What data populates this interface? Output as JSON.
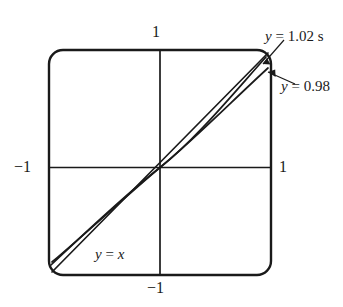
{
  "figure": {
    "title": "",
    "background_color": "#ffffff",
    "stroke_color": "#1a1a1a"
  },
  "axes": {
    "x_tick_labels": {
      "left": "−1",
      "right": "1"
    },
    "y_tick_labels": {
      "top": "1",
      "bottom": "−1"
    },
    "xlim": [
      -1,
      1
    ],
    "ylim": [
      -1,
      1
    ],
    "frame": "rounded-square",
    "grid": false
  },
  "annotations": [
    {
      "id": "c1",
      "text": "y = 1.02 s",
      "italic_var": "y",
      "clipped": true,
      "leader": true
    },
    {
      "id": "c2",
      "text": "y = 0.98",
      "italic_var": "y",
      "clipped": true,
      "leader": true
    },
    {
      "id": "c3",
      "text": "y = x",
      "italic_var": "y",
      "clipped": false,
      "leader": false
    }
  ],
  "chart_data": {
    "type": "line",
    "title": "",
    "xlabel": "",
    "ylabel": "",
    "xlim": [
      -1,
      1
    ],
    "ylim": [
      -1,
      1
    ],
    "grid": false,
    "legend_position": "inline-annotations",
    "xticks": [
      -1,
      1
    ],
    "xticklabels": [
      "−1",
      "1"
    ],
    "yticks": [
      -1,
      1
    ],
    "yticklabels": [
      "−1",
      "1"
    ],
    "x": [
      -1,
      -0.9,
      -0.8,
      -0.7,
      -0.6,
      -0.5,
      -0.4,
      -0.3,
      -0.2,
      -0.1,
      0,
      0.1,
      0.2,
      0.3,
      0.4,
      0.5,
      0.6,
      0.7,
      0.8,
      0.9,
      1
    ],
    "series": [
      {
        "name": "y = x",
        "label": "y = x",
        "values": [
          -1,
          -0.9,
          -0.8,
          -0.7,
          -0.6,
          -0.5,
          -0.4,
          -0.3,
          -0.2,
          -0.1,
          0,
          0.1,
          0.2,
          0.3,
          0.4,
          0.5,
          0.6,
          0.7,
          0.8,
          0.9,
          1
        ]
      },
      {
        "name": "y = 1.02 sin x",
        "label": "y = 1.02 s",
        "values": [
          -0.858,
          -0.799,
          -0.732,
          -0.657,
          -0.576,
          -0.489,
          -0.397,
          -0.301,
          -0.203,
          -0.102,
          0,
          0.102,
          0.203,
          0.301,
          0.397,
          0.489,
          0.576,
          0.657,
          0.732,
          0.799,
          0.858
        ]
      },
      {
        "name": "y = 0.98 x-ish",
        "label": "y = 0.98",
        "values": [
          -0.824,
          -0.768,
          -0.703,
          -0.631,
          -0.553,
          -0.47,
          -0.382,
          -0.289,
          -0.195,
          -0.098,
          0,
          0.098,
          0.195,
          0.289,
          0.382,
          0.47,
          0.553,
          0.631,
          0.703,
          0.768,
          0.824
        ]
      }
    ]
  }
}
